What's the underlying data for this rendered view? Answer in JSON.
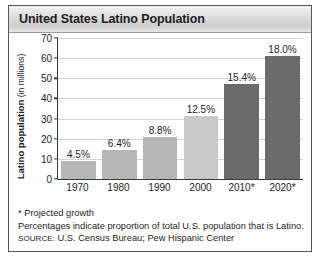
{
  "figure": {
    "title": "United States Latino Population"
  },
  "chart_data": {
    "type": "bar",
    "title": "United States Latino Population",
    "xlabel": "",
    "ylabel": "Latino population (in millions)",
    "ylabel_main": "Latino population",
    "ylabel_unit": " (in millions)",
    "ylim": [
      0,
      70
    ],
    "ytick_step": 10,
    "yticks": [
      0,
      10,
      20,
      30,
      40,
      50,
      60,
      70
    ],
    "grid": true,
    "legend": "none",
    "categories": [
      "1970",
      "1980",
      "1990",
      "2000",
      "2010*",
      "2020*"
    ],
    "values": [
      9.1,
      14.6,
      21.0,
      31.3,
      47.0,
      61.0
    ],
    "data_labels": [
      "4.5%",
      "6.4%",
      "8.8%",
      "12.5%",
      "15.4%",
      "18.0%"
    ],
    "bar_colors": [
      "#b6b6b6",
      "#b6b6b6",
      "#b6b6b6",
      "#c9c9c9",
      "#6b6b6b",
      "#6b6b6b"
    ],
    "colors": {
      "bar_light": "#b6b6b6",
      "bar_light_alt": "#c9c9c9",
      "bar_dark": "#6b6b6b",
      "axis": "#3a3a3a",
      "gridline": "#d2d2d2",
      "text": "#1d1d1d",
      "frame": "#58585a"
    },
    "annotations": [
      "* Projected growth",
      "Percentages indicate proportion of total U.S. population that is Latino."
    ]
  },
  "footnotes": {
    "projected": "* Projected growth",
    "percent_note": "Percentages indicate proportion of total U.S. population that is Latino.",
    "source_key": "SOURCE:",
    "source_value": " U.S. Census Bureau; Pew Hispanic Center"
  }
}
